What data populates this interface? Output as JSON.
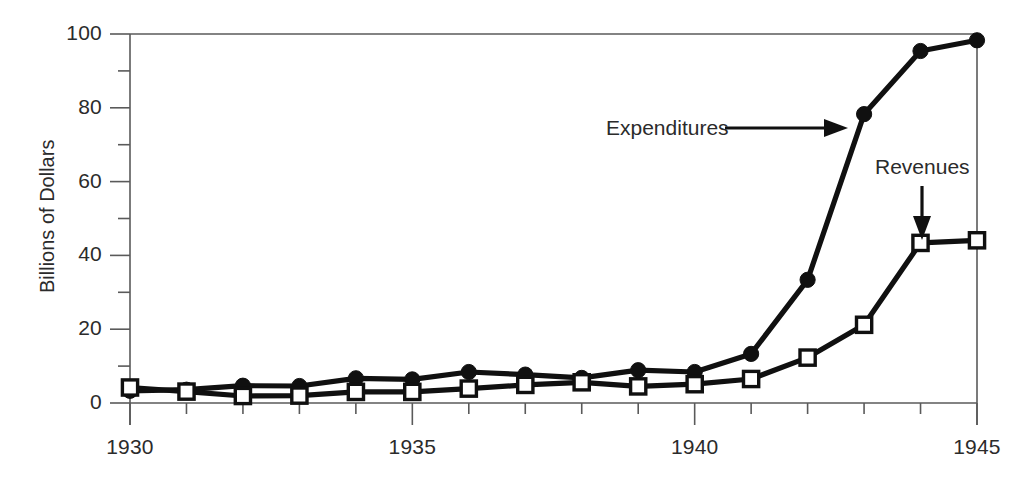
{
  "chart_data": {
    "type": "line",
    "title": "",
    "xlabel": "",
    "ylabel": "Billions of Dollars",
    "x": [
      1930,
      1931,
      1932,
      1933,
      1934,
      1935,
      1936,
      1937,
      1938,
      1939,
      1940,
      1941,
      1942,
      1943,
      1944,
      1945
    ],
    "xlim": [
      1930,
      1945
    ],
    "ylim": [
      0,
      100
    ],
    "grid": false,
    "legend_position": "inline-annotations",
    "xticks_major": [
      1930,
      1935,
      1940,
      1945
    ],
    "xticks_minor": [
      1931,
      1932,
      1933,
      1934,
      1936,
      1937,
      1938,
      1939,
      1941,
      1942,
      1943,
      1944
    ],
    "xtick_labels": [
      "1930",
      "1935",
      "1940",
      "1945"
    ],
    "yticks_major": [
      0,
      20,
      40,
      60,
      80,
      100
    ],
    "yticks_minor": [
      10,
      30,
      50,
      70,
      90
    ],
    "ytick_labels": [
      "0",
      "20",
      "40",
      "60",
      "80",
      "100"
    ],
    "series": [
      {
        "name": "Expenditures",
        "marker": "filled-circle",
        "color": "#101010",
        "values": [
          3.3,
          3.6,
          4.7,
          4.6,
          6.7,
          6.4,
          8.4,
          7.7,
          6.8,
          8.9,
          8.4,
          13.3,
          33.4,
          78.3,
          95.4,
          98.3
        ]
      },
      {
        "name": "Revenues",
        "marker": "open-square",
        "color": "#101010",
        "values": [
          4.2,
          3.1,
          1.9,
          2.0,
          3.0,
          3.0,
          3.9,
          4.9,
          5.6,
          4.5,
          5.1,
          6.5,
          12.3,
          21.2,
          43.4,
          44.1
        ]
      }
    ],
    "annotations": [
      {
        "text": "Expenditures",
        "points_to_series": "Expenditures",
        "arrow_direction": "right"
      },
      {
        "text": "Revenues",
        "points_to_series": "Revenues",
        "arrow_direction": "down"
      }
    ]
  },
  "axis_label": {
    "y": "Billions of Dollars"
  },
  "annotations": {
    "expenditures": "Expenditures",
    "revenues": "Revenues"
  },
  "colors": {
    "series": "#101010",
    "axis": "#5a5a5a",
    "text": "#2b2b2b",
    "background": "#ffffff"
  }
}
